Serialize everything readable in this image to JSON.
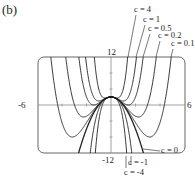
{
  "panel_label": "(b)",
  "chart_data": {
    "type": "line",
    "title": "",
    "xlabel": "",
    "ylabel": "",
    "function": "f(x) = c x^4 - x^2 (family of curves)",
    "xlim": [
      -6,
      6
    ],
    "ylim": [
      -12,
      12
    ],
    "tick_labels": {
      "x_min": "-6",
      "x_max": "6",
      "y_max": "12",
      "y_min": "-12"
    },
    "grid": false,
    "series": [
      {
        "name": "c = 4",
        "c": 4,
        "label": "c = 4"
      },
      {
        "name": "c = 1",
        "c": 1,
        "label": "c = 1"
      },
      {
        "name": "c = 0.5",
        "c": 0.5,
        "label": "c = 0.5"
      },
      {
        "name": "c = 0.2",
        "c": 0.2,
        "label": "c = 0.2"
      },
      {
        "name": "c = 0.1",
        "c": 0.1,
        "label": "c = 0.1"
      },
      {
        "name": "c = 0",
        "c": 0,
        "label": "c = 0"
      },
      {
        "name": "c = -1",
        "c": -1,
        "label": "c = -1"
      },
      {
        "name": "c = -4",
        "c": -4,
        "label": "c = -4"
      }
    ],
    "annotations": [
      "c = 4",
      "c = 1",
      "c = 0.5",
      "c = 0.2",
      "c = 0.1",
      "c = 0",
      "c = -1",
      "c = -4"
    ]
  },
  "colors": {
    "ink": "#231f20",
    "axis": "#7a7a7a",
    "frame": "#555555"
  }
}
